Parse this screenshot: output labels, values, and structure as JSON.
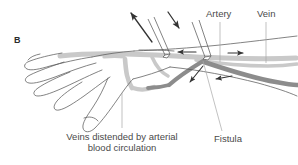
{
  "figure": {
    "panel_letter": "B",
    "background_color": "#ffffff",
    "text_color": "#4a4a4a",
    "artery_color": "#8c8c8c",
    "vein_color": "#c9c9c9",
    "outline_color": "#5a5a5a",
    "arrow_color": "#333333",
    "leader_color": "#a8a8a8"
  },
  "labels": {
    "artery": "Artery",
    "vein": "Vein",
    "fistula": "Fistula",
    "caption_line1": "Veins distended by arterial",
    "caption_line2": "blood circulation"
  },
  "icons": {
    "needle_upper_left": "arrow-up-left-icon",
    "needle_upper_right": "arrow-down-right-icon",
    "flow_left_upper": "arrow-left-icon",
    "flow_right_upper": "arrow-right-icon",
    "flow_down_left": "arrow-down-left-icon",
    "flow_left_lower": "arrow-left-icon"
  }
}
